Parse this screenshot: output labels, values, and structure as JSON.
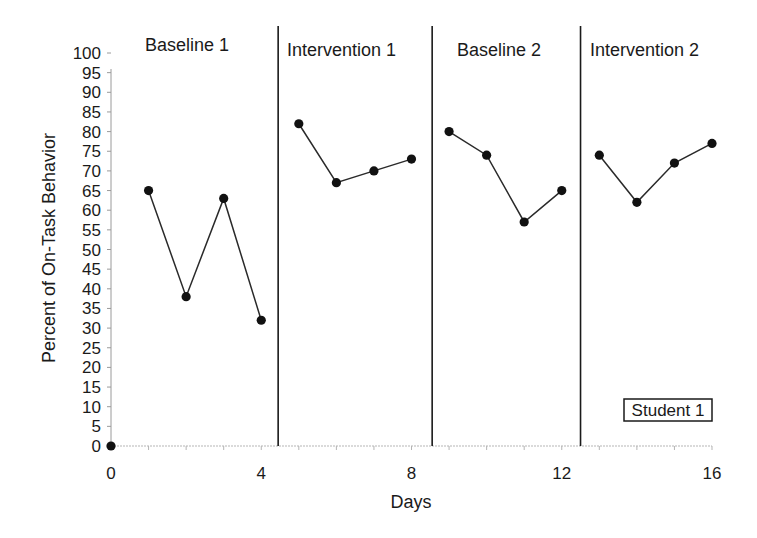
{
  "chart_data": {
    "type": "line",
    "title": "",
    "xlabel": "Days",
    "ylabel": "Percent of On-Task Behavior",
    "xlim": [
      0,
      16
    ],
    "ylim": [
      0,
      100
    ],
    "x_ticks": [
      0,
      4,
      8,
      12,
      16
    ],
    "y_ticks": [
      0,
      5,
      10,
      15,
      20,
      25,
      30,
      35,
      40,
      45,
      50,
      55,
      60,
      65,
      70,
      75,
      80,
      85,
      90,
      95,
      100
    ],
    "grid": false,
    "legend_position": "lower right",
    "legend": [
      "Student 1"
    ],
    "phase_lines": [
      4.45,
      8.55,
      12.5
    ],
    "phases": [
      {
        "name": "Baseline 1",
        "days": [
          1,
          2,
          3,
          4
        ],
        "values": [
          65,
          38,
          63,
          32
        ]
      },
      {
        "name": "Intervention 1",
        "days": [
          5,
          6,
          7,
          8
        ],
        "values": [
          82,
          67,
          70,
          73
        ]
      },
      {
        "name": "Baseline 2",
        "days": [
          9,
          10,
          11,
          12
        ],
        "values": [
          80,
          74,
          57,
          65
        ]
      },
      {
        "name": "Intervention 2",
        "days": [
          13,
          14,
          15,
          16
        ],
        "values": [
          74,
          62,
          72,
          77
        ]
      }
    ],
    "series": [
      {
        "name": "Student 1",
        "x": [
          0,
          1,
          2,
          3,
          4,
          5,
          6,
          7,
          8,
          9,
          10,
          11,
          12,
          13,
          14,
          15,
          16
        ],
        "values": [
          0,
          65,
          38,
          63,
          32,
          82,
          67,
          70,
          73,
          80,
          74,
          57,
          65,
          74,
          62,
          72,
          77
        ]
      }
    ],
    "origin_point": {
      "x": 0,
      "y": 0
    }
  },
  "labels": {
    "phase_1": "Baseline 1",
    "phase_2": "Intervention 1",
    "phase_3": "Baseline 2",
    "phase_4": "Intervention 2",
    "x_axis_title": "Days",
    "y_axis_title": "Percent of On-Task Behavior",
    "legend": "Student 1"
  }
}
